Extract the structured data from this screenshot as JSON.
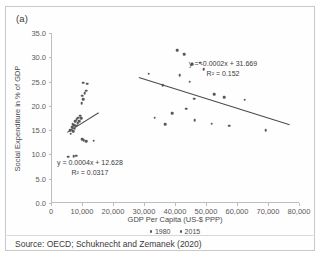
{
  "figure": {
    "panel_label": "(a)",
    "source": "Source: OECD; Schuknecht and Zemanek (2020)"
  },
  "chart_data": {
    "type": "scatter",
    "title": "",
    "xlabel": "GDP Per Capita (US-$ PPP)",
    "ylabel": "Social Expenditure in % of GDP",
    "xlim": [
      0,
      80000
    ],
    "ylim": [
      0,
      35
    ],
    "xticks": [
      0,
      10000,
      20000,
      30000,
      40000,
      50000,
      60000,
      70000,
      80000
    ],
    "xtick_labels": [
      "0",
      "10,000",
      "20,000",
      "30,000",
      "40,000",
      "50,000",
      "60,000",
      "70,000",
      "80,000"
    ],
    "yticks": [
      0,
      5,
      10,
      15,
      20,
      25,
      30,
      35
    ],
    "ytick_labels": [
      "0.0",
      "5.0",
      "10.0",
      "15.0",
      "20.0",
      "25.0",
      "30.0",
      "35.0"
    ],
    "grid": false,
    "legend_position": "bottom",
    "marker_color": "#595959",
    "trendline_color": "#4a4a4a",
    "series": [
      {
        "name": "1980",
        "points": [
          [
            5600,
            9.5
          ],
          [
            7300,
            9.6
          ],
          [
            8200,
            9.7
          ],
          [
            6100,
            15.0
          ],
          [
            6400,
            14.3
          ],
          [
            6800,
            15.6
          ],
          [
            7000,
            16.2
          ],
          [
            7200,
            14.8
          ],
          [
            7500,
            16.0
          ],
          [
            7700,
            15.3
          ],
          [
            7900,
            16.8
          ],
          [
            8100,
            15.9
          ],
          [
            8300,
            17.2
          ],
          [
            8600,
            16.4
          ],
          [
            8800,
            17.6
          ],
          [
            9100,
            16.9
          ],
          [
            9400,
            18.0
          ],
          [
            9700,
            17.4
          ],
          [
            10000,
            13.1
          ],
          [
            10600,
            12.9
          ],
          [
            11300,
            12.7
          ],
          [
            13800,
            12.8
          ],
          [
            9900,
            20.6
          ],
          [
            10300,
            21.4
          ],
          [
            10100,
            22.1
          ],
          [
            10900,
            22.6
          ],
          [
            11400,
            23.1
          ],
          [
            10400,
            24.8
          ],
          [
            11700,
            24.6
          ]
        ]
      },
      {
        "name": "2015",
        "points": [
          [
            31500,
            26.6
          ],
          [
            36000,
            24.2
          ],
          [
            40800,
            31.5
          ],
          [
            43000,
            30.6
          ],
          [
            45500,
            28.6
          ],
          [
            48200,
            28.9
          ],
          [
            49300,
            27.6
          ],
          [
            41500,
            26.3
          ],
          [
            44800,
            25.0
          ],
          [
            46200,
            21.5
          ],
          [
            52600,
            22.4
          ],
          [
            55800,
            21.8
          ],
          [
            62500,
            21.3
          ],
          [
            39100,
            18.5
          ],
          [
            43600,
            19.4
          ],
          [
            46400,
            17.0
          ],
          [
            51800,
            16.3
          ],
          [
            57500,
            15.9
          ],
          [
            69300,
            15.0
          ],
          [
            33500,
            17.6
          ],
          [
            36800,
            16.2
          ]
        ]
      }
    ],
    "trendlines": [
      {
        "series": "2015",
        "equation": "y = -0.0002x + 31.669",
        "r2_label": "R² = 0.152",
        "slope": -0.0002,
        "intercept": 31.669,
        "r2": 0.152,
        "x_start": 28500,
        "x_end": 77000
      },
      {
        "series": "1980",
        "equation": "y = 0.0004x + 12.628",
        "r2_label": "R² = 0.0317",
        "slope": 0.0004,
        "intercept": 12.628,
        "r2": 0.0317,
        "x_start": 5200,
        "x_end": 15200
      }
    ]
  }
}
